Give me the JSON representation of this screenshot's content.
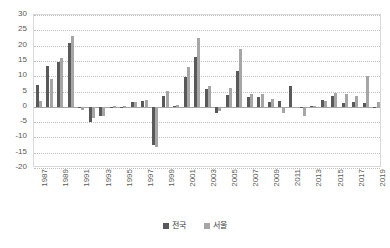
{
  "chart_data": {
    "type": "bar",
    "title": "",
    "subtitle": "",
    "xlabel": "",
    "ylabel": "",
    "ylim": [
      -20,
      30
    ],
    "ytick_step": 5,
    "yticks": [
      30,
      25,
      20,
      15,
      10,
      5,
      0,
      -5,
      -10,
      -15,
      -20
    ],
    "grid": true,
    "legend_position": "bottom",
    "x": [
      1987,
      1988,
      1989,
      1990,
      1991,
      1992,
      1993,
      1994,
      1995,
      1996,
      1997,
      1998,
      1999,
      2000,
      2001,
      2002,
      2003,
      2004,
      2005,
      2006,
      2007,
      2008,
      2009,
      2010,
      2011,
      2012,
      2013,
      2014,
      2015,
      2016,
      2017,
      2018,
      2019
    ],
    "xtick_labels": [
      "1987",
      "1989",
      "1991",
      "1993",
      "1995",
      "1997",
      "1999",
      "2001",
      "2003",
      "2005",
      "2007",
      "2009",
      "2011",
      "2013",
      "2015",
      "2017",
      "2019"
    ],
    "categories": [
      "1987",
      "1988",
      "1989",
      "1990",
      "1991",
      "1992",
      "1993",
      "1994",
      "1995",
      "1996",
      "1997",
      "1998",
      "1999",
      "2000",
      "2001",
      "2002",
      "2003",
      "2004",
      "2005",
      "2006",
      "2007",
      "2008",
      "2009",
      "2010",
      "2011",
      "2012",
      "2013",
      "2014",
      "2015",
      "2016",
      "2017",
      "2018",
      "2019"
    ],
    "series": [
      {
        "name": "전국",
        "color": "#595959",
        "values": [
          7.1,
          13.2,
          14.6,
          21.0,
          -0.5,
          -5.0,
          -2.9,
          -0.1,
          -0.2,
          1.5,
          2.0,
          -12.4,
          3.4,
          0.4,
          9.9,
          16.4,
          5.7,
          -2.1,
          4.0,
          11.6,
          3.1,
          3.1,
          1.5,
          1.9,
          6.9,
          -0.0,
          0.3,
          2.1,
          3.5,
          1.3,
          1.5,
          1.1,
          -0.4
        ]
      },
      {
        "name": "서울",
        "color": "#a6a6a6",
        "values": [
          1.8,
          9.0,
          16.0,
          23.0,
          -1.0,
          -3.7,
          -3.1,
          0.1,
          0.2,
          1.6,
          2.1,
          -13.2,
          5.3,
          0.6,
          12.9,
          22.5,
          6.9,
          -1.4,
          6.3,
          18.9,
          4.3,
          4.1,
          2.4,
          -2.1,
          -0.4,
          -2.9,
          0.2,
          1.8,
          4.6,
          4.2,
          3.6,
          10.2,
          1.5
        ]
      }
    ]
  },
  "legend": {
    "items": [
      {
        "label": "전국",
        "color": "#595959"
      },
      {
        "label": "서울",
        "color": "#a6a6a6"
      }
    ]
  }
}
